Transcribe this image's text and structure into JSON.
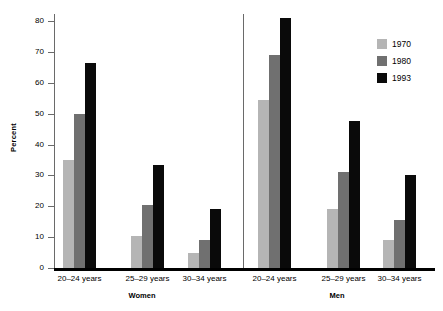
{
  "chart_data": {
    "type": "bar",
    "title": "",
    "xlabel": "",
    "ylabel": "Percent",
    "ylim": [
      0,
      80
    ],
    "yticks": [
      0,
      10,
      20,
      30,
      40,
      50,
      60,
      70,
      80
    ],
    "ytick_labels": [
      "0",
      "10",
      "20",
      "30",
      "40",
      "50",
      "60",
      "70",
      "80"
    ],
    "grid": false,
    "legend_position": "top-right",
    "panels": [
      {
        "name": "Women",
        "categories": [
          "20–24 years",
          "25–29 years",
          "30–34 years"
        ],
        "series": [
          {
            "name": "1970",
            "color": "#b5b5b5",
            "values": [
              35.0,
              10.5,
              5.0
            ]
          },
          {
            "name": "1980",
            "color": "#707070",
            "values": [
              50.0,
              20.5,
              9.0
            ]
          },
          {
            "name": "1993",
            "color": "#0a0a0a",
            "values": [
              66.5,
              33.5,
              19.0
            ]
          }
        ]
      },
      {
        "name": "Men",
        "categories": [
          "20–24 years",
          "25–29 years",
          "30–34 years"
        ],
        "series": [
          {
            "name": "1970",
            "color": "#b5b5b5",
            "values": [
              54.5,
              19.0,
              9.0
            ]
          },
          {
            "name": "1980",
            "color": "#707070",
            "values": [
              69.0,
              31.0,
              15.5
            ]
          },
          {
            "name": "1993",
            "color": "#0a0a0a",
            "values": [
              81.0,
              47.5,
              30.0
            ]
          }
        ]
      }
    ],
    "legend": [
      {
        "label": "1970",
        "color": "#b5b5b5"
      },
      {
        "label": "1980",
        "color": "#707070"
      },
      {
        "label": "1993",
        "color": "#0a0a0a"
      }
    ]
  },
  "axis": {
    "y_title": "Percent"
  },
  "colors": {
    "series_1970": "#b5b5b5",
    "series_1980": "#707070",
    "series_1993": "#0a0a0a",
    "axis": "#6a6a6a",
    "baseline": "#000000",
    "background": "#ffffff"
  }
}
